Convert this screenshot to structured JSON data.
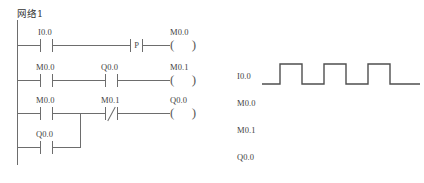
{
  "network": {
    "title": "网络1"
  },
  "colors": {
    "line": "#6d6d6d",
    "text": "#3f3f3f",
    "background": "#ffffff"
  },
  "ladder": {
    "rungs": [
      {
        "id": "rung-1",
        "elements": [
          {
            "type": "contact-no",
            "operand": "I0.0"
          },
          {
            "type": "contact-p",
            "operand": "",
            "glyph": "P"
          },
          {
            "type": "coil",
            "operand": "M0.0"
          }
        ]
      },
      {
        "id": "rung-2",
        "elements": [
          {
            "type": "contact-no",
            "operand": "M0.0"
          },
          {
            "type": "contact-no",
            "operand": "Q0.0"
          },
          {
            "type": "coil",
            "operand": "M0.1"
          }
        ]
      },
      {
        "id": "rung-3",
        "elements": [
          {
            "type": "contact-no",
            "operand": "M0.0"
          },
          {
            "type": "contact-nc",
            "operand": "M0.1"
          },
          {
            "type": "coil",
            "operand": "Q0.0"
          }
        ],
        "branch": {
          "id": "branch-3a",
          "elements": [
            {
              "type": "contact-no",
              "operand": "Q0.0"
            }
          ]
        }
      }
    ]
  },
  "timing": {
    "signals": [
      {
        "name": "I0.0",
        "has_waveform": true
      },
      {
        "name": "M0.0",
        "has_waveform": false
      },
      {
        "name": "M0.1",
        "has_waveform": false
      },
      {
        "name": "Q0.0",
        "has_waveform": false
      }
    ],
    "waveform": {
      "signal": "I0.0",
      "pulse_count": 3,
      "points": "0,22 18,22 18,2 40,2 40,22 62,22 62,2 84,2 84,22 106,22 106,2 128,2 128,22 158,22"
    }
  }
}
